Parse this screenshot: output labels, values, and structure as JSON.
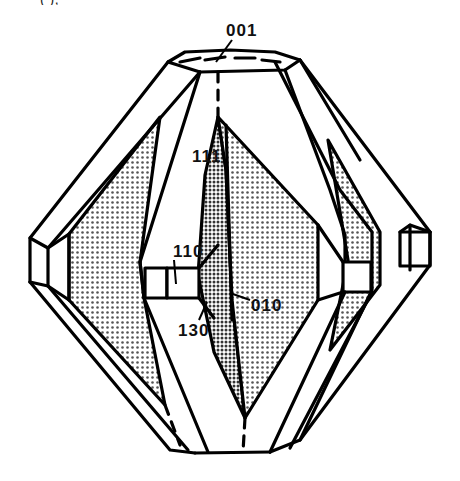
{
  "figure": {
    "type": "crystal-habit-drawing",
    "caption_fragment": "( ), ",
    "face_labels": [
      {
        "id": "face-001",
        "text": "001",
        "x": 226,
        "y": 30
      },
      {
        "id": "face-111",
        "text": "111",
        "x": 192,
        "y": 148
      },
      {
        "id": "face-110",
        "text": "110",
        "x": 173,
        "y": 243
      },
      {
        "id": "face-130",
        "text": "130",
        "x": 178,
        "y": 322
      },
      {
        "id": "face-010",
        "text": "010",
        "x": 251,
        "y": 297
      }
    ],
    "colors": {
      "line": "#000000",
      "shade_light": "#c8c8c8",
      "shade_dark": "#9a9a9a",
      "background": "#ffffff"
    }
  }
}
